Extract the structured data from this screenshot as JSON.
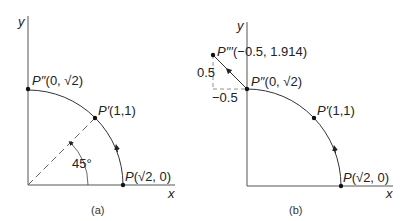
{
  "panels": [
    {
      "id": "a",
      "caption": "(a)",
      "axis_x_label": "x",
      "axis_y_label": "y",
      "angle_label": "45°",
      "points": {
        "P": {
          "name": "P",
          "coords": "(√2, 0)"
        },
        "P1": {
          "name": "P′",
          "coords": "(1,1)"
        },
        "P2": {
          "name": "P′′",
          "coords": "(0, √2)"
        }
      }
    },
    {
      "id": "b",
      "caption": "(b)",
      "axis_x_label": "x",
      "axis_y_label": "y",
      "points": {
        "P": {
          "name": "P",
          "coords": "(√2, 0)"
        },
        "P1": {
          "name": "P′",
          "coords": "(1,1)"
        },
        "P2": {
          "name": "P′′",
          "coords": "(0, √2)"
        },
        "P3": {
          "name": "P′′′",
          "coords": "(−0.5, 1.914)"
        }
      },
      "dim_vertical": "0.5",
      "dim_horizontal": "−0.5"
    }
  ]
}
